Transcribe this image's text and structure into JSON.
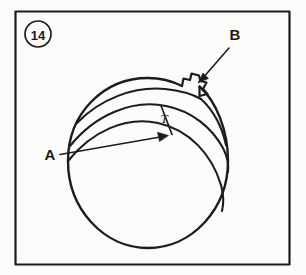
{
  "figure": {
    "number_label": "14",
    "background_color": "#fbfbf9",
    "ink_color": "#1c1c1c",
    "frame": {
      "x": 15,
      "y": 11,
      "width": 275,
      "height": 254
    }
  },
  "labels": {
    "callout_a": "A",
    "callout_b": "B",
    "dimension_t": "T"
  },
  "diagram": {
    "ball": {
      "cx": 148,
      "cy": 163,
      "rx": 80,
      "ry": 85
    },
    "band_count": 3,
    "stem_name": "valve-stem-notch",
    "arrows": [
      {
        "name": "callout-arrow-a",
        "from_x": 62,
        "from_y": 155,
        "to_x": 165,
        "to_y": 136
      },
      {
        "name": "callout-arrow-b",
        "from_x": 228,
        "from_y": 44,
        "to_x": 199,
        "to_y": 79
      }
    ]
  }
}
